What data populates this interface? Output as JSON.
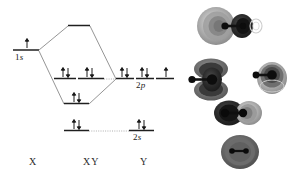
{
  "figure": {
    "type": "molecular-orbital-energy-level-diagram",
    "background": "#ffffff",
    "ink": "#1a1a1a"
  },
  "axis_labels": [
    {
      "id": "x",
      "text": "X",
      "x": 29,
      "y": 160
    },
    {
      "id": "xy",
      "text": "XY",
      "x": 83,
      "y": 160
    },
    {
      "id": "y",
      "text": "Y",
      "x": 140,
      "y": 160
    }
  ],
  "levels": [
    {
      "id": "x-1s",
      "name": "X 1s atomic orbital",
      "label": "1s",
      "label_italic_from": 1,
      "column": "X",
      "x": 13,
      "y": 50,
      "width": 26,
      "label_x": 15,
      "label_y": 52,
      "electrons": [
        {
          "up": true,
          "down": false
        }
      ]
    },
    {
      "id": "mo-sigma-star",
      "name": "antibonding sigma* molecular orbital",
      "label": "",
      "column": "XY",
      "x": 68,
      "y": 25,
      "width": 22,
      "electrons": []
    },
    {
      "id": "mo-pi-1",
      "name": "bonding pi molecular orbital 1",
      "label": "",
      "column": "XY",
      "x": 54,
      "y": 78,
      "width": 22,
      "electrons": [
        {
          "up": true,
          "down": true
        }
      ]
    },
    {
      "id": "mo-pi-2",
      "name": "bonding pi molecular orbital 2",
      "label": "",
      "column": "XY",
      "x": 77,
      "y": 78,
      "width": 27,
      "electrons": [
        {
          "up": true,
          "down": true
        }
      ]
    },
    {
      "id": "mo-sigma",
      "name": "bonding sigma molecular orbital",
      "label": "",
      "column": "XY",
      "x": 64,
      "y": 103,
      "width": 25,
      "electrons": [
        {
          "up": true,
          "down": true
        }
      ]
    },
    {
      "id": "y-2p-1",
      "name": "Y 2p atomic orbital 1",
      "label": "",
      "column": "Y",
      "x": 116,
      "y": 78,
      "width": 18,
      "electrons": [
        {
          "up": true,
          "down": true
        }
      ]
    },
    {
      "id": "y-2p-2",
      "name": "Y 2p atomic orbital 2",
      "label": "2p",
      "label_italic_from": 1,
      "column": "Y",
      "x": 136,
      "y": 78,
      "width": 18,
      "label_x": 137,
      "label_y": 80,
      "electrons": [
        {
          "up": true,
          "down": true
        }
      ]
    },
    {
      "id": "y-2p-3",
      "name": "Y 2p atomic orbital 3",
      "label": "",
      "column": "Y",
      "x": 156,
      "y": 78,
      "width": 18,
      "electrons": [
        {
          "up": true,
          "down": false
        }
      ]
    },
    {
      "id": "xy-2s-left",
      "name": "XY 2s level left segment",
      "label": "",
      "column": "XY",
      "x": 64,
      "y": 130,
      "width": 25,
      "electrons": [
        {
          "up": true,
          "down": true
        }
      ]
    },
    {
      "id": "y-2s",
      "name": "Y 2s atomic orbital",
      "label": "2s",
      "label_italic_from": 1,
      "column": "Y",
      "x": 129,
      "y": 130,
      "width": 25,
      "label_x": 133,
      "label_y": 132,
      "electrons": [
        {
          "up": true,
          "down": true
        }
      ]
    }
  ],
  "correlation_lines": [
    {
      "id": "line-1s-to-sigma-star",
      "from": [
        39,
        50
      ],
      "to": [
        68,
        26
      ]
    },
    {
      "id": "line-1s-to-sigma",
      "from": [
        39,
        51
      ],
      "to": [
        64,
        104
      ]
    },
    {
      "id": "line-sigma-star-to-2p",
      "from": [
        90,
        26
      ],
      "to": [
        116,
        79
      ]
    },
    {
      "id": "line-sigma-to-2p",
      "from": [
        89,
        104
      ],
      "to": [
        116,
        79
      ]
    },
    {
      "id": "line-2s-dotted",
      "from": [
        89,
        131
      ],
      "to": [
        129,
        131
      ],
      "style": "dotted"
    },
    {
      "id": "line-pi-dotted",
      "from": [
        104,
        79
      ],
      "to": [
        116,
        79
      ],
      "style": "dotted"
    }
  ],
  "orbital_renderings": [
    {
      "id": "orbital-sigma-star",
      "name": "sigma-antibonding-orbital-contour",
      "x": 196,
      "y": 6,
      "w": 72,
      "h": 48,
      "caption": "",
      "lobes": "large light lobe left, dark lobe right, faint small ring far right",
      "axis_angle": 0
    },
    {
      "id": "orbital-pi-left",
      "name": "pi-orbital-contour-left",
      "x": 183,
      "y": 58,
      "w": 62,
      "h": 44,
      "caption": "",
      "lobes": "two dark lobes above and below bond axis",
      "axis_angle": 0
    },
    {
      "id": "orbital-pi-right",
      "name": "pi-orbital-contour-right",
      "x": 248,
      "y": 58,
      "w": 46,
      "h": 42,
      "caption": "",
      "lobes": "compact concentric dark orbital",
      "axis_angle": 0
    },
    {
      "id": "orbital-sigma-bonding",
      "name": "sigma-bonding-orbital-contour",
      "x": 213,
      "y": 95,
      "w": 56,
      "h": 38,
      "caption": "",
      "lobes": "dark lobe left, lighter lobe right across bond",
      "axis_angle": 0
    },
    {
      "id": "orbital-2s",
      "name": "sigma-2s-orbital-contour",
      "x": 219,
      "y": 132,
      "w": 42,
      "h": 40,
      "caption": "",
      "lobes": "single rounded grey envelope enclosing both nuclei",
      "axis_angle": 0
    }
  ],
  "colors": {
    "ink": "#1a1a1a",
    "line": "#6e6e6e",
    "dotted": "#9a9a9a",
    "orbital_dark": "#2a2a2a",
    "orbital_mid": "#6b6b6b",
    "orbital_light": "#a8a8a8",
    "orbital_pale": "#cfcfcf"
  }
}
